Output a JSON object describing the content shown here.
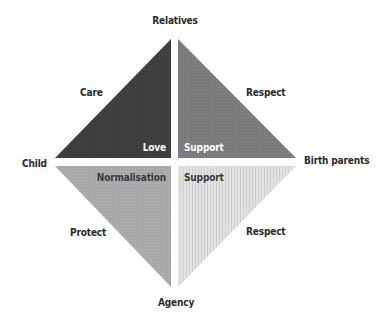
{
  "diagram": {
    "type": "quadrant-diamond",
    "vertices": {
      "top": "Relatives",
      "left": "Child",
      "right": "Birth parents",
      "bottom": "Agency"
    },
    "quadrants": [
      {
        "id": "top-left",
        "edge_label": "Care",
        "inner_label": "Love",
        "fill": "#3f3f3f",
        "pattern": "dense-dots"
      },
      {
        "id": "top-right",
        "edge_label": "Respect",
        "inner_label": "Support",
        "fill": "#7c7c7c",
        "pattern": "dots"
      },
      {
        "id": "bottom-left",
        "edge_label": "Protect",
        "inner_label": "Normalisation",
        "fill": "#a9a9a9",
        "pattern": "dots"
      },
      {
        "id": "bottom-right",
        "edge_label": "Respect",
        "inner_label": "Support",
        "fill": "#dcdcdc",
        "pattern": "vertical-stripes"
      }
    ],
    "colors": {
      "text": "#2a2a2a",
      "inner_text_light": "#ffffff",
      "inner_text_dark": "#3a3a3a",
      "background": "#ffffff"
    }
  }
}
